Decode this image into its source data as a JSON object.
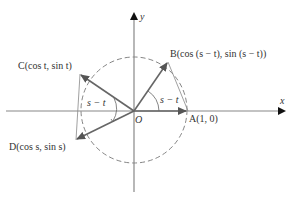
{
  "diagram": {
    "type": "unit-circle",
    "axes": {
      "x_label": "x",
      "y_label": "y",
      "origin_label": "O"
    },
    "points": {
      "A": {
        "label": "A(1, 0)"
      },
      "B": {
        "label": "B(cos (s − t), sin (s − t))"
      },
      "C": {
        "label": "C(cos t, sin t)"
      },
      "D": {
        "label": "D(cos s, sin s)"
      }
    },
    "angles": {
      "AOB": {
        "label": "s − t"
      },
      "COD": {
        "label": "s − t"
      }
    },
    "colors": {
      "axis": "#888888",
      "vector": "#666666",
      "circle": "#777777",
      "arrowhead": "#111111",
      "text": "#333333"
    }
  }
}
